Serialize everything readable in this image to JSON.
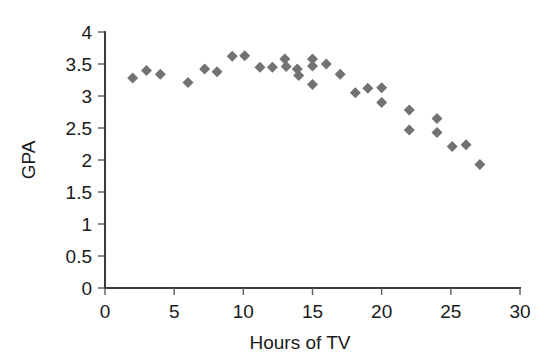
{
  "chart_data": {
    "type": "scatter",
    "title": "",
    "xlabel": "Hours of TV",
    "ylabel": "GPA",
    "xlim": [
      0,
      30
    ],
    "ylim": [
      0,
      4
    ],
    "grid": false,
    "legend": null,
    "marker": {
      "shape": "diamond",
      "color": "#727272",
      "size_px": 11
    },
    "axis_color": "#3a3a3a",
    "xticks": [
      0,
      5,
      10,
      15,
      20,
      25,
      30
    ],
    "xtick_labels": [
      "0",
      "5",
      "10",
      "15",
      "20",
      "25",
      "30"
    ],
    "yticks": [
      0,
      0.5,
      1,
      1.5,
      2,
      2.5,
      3,
      3.5,
      4
    ],
    "ytick_labels": [
      "0",
      "0.5",
      "1",
      "1.5",
      "2",
      "2.5",
      "3",
      "3.5",
      "4"
    ],
    "series": [
      {
        "name": "students",
        "points": [
          {
            "x": 2.0,
            "y": 3.28
          },
          {
            "x": 3.0,
            "y": 3.4
          },
          {
            "x": 4.0,
            "y": 3.34
          },
          {
            "x": 6.0,
            "y": 3.21
          },
          {
            "x": 7.2,
            "y": 3.42
          },
          {
            "x": 8.1,
            "y": 3.38
          },
          {
            "x": 9.2,
            "y": 3.62
          },
          {
            "x": 10.1,
            "y": 3.63
          },
          {
            "x": 11.2,
            "y": 3.45
          },
          {
            "x": 12.1,
            "y": 3.45
          },
          {
            "x": 13.0,
            "y": 3.58
          },
          {
            "x": 13.1,
            "y": 3.46
          },
          {
            "x": 13.9,
            "y": 3.42
          },
          {
            "x": 14.0,
            "y": 3.32
          },
          {
            "x": 15.0,
            "y": 3.58
          },
          {
            "x": 15.0,
            "y": 3.47
          },
          {
            "x": 15.0,
            "y": 3.18
          },
          {
            "x": 16.0,
            "y": 3.5
          },
          {
            "x": 17.0,
            "y": 3.34
          },
          {
            "x": 18.1,
            "y": 3.05
          },
          {
            "x": 19.0,
            "y": 3.12
          },
          {
            "x": 20.0,
            "y": 3.13
          },
          {
            "x": 20.0,
            "y": 2.9
          },
          {
            "x": 22.0,
            "y": 2.78
          },
          {
            "x": 22.0,
            "y": 2.47
          },
          {
            "x": 24.0,
            "y": 2.65
          },
          {
            "x": 24.0,
            "y": 2.43
          },
          {
            "x": 25.1,
            "y": 2.21
          },
          {
            "x": 26.1,
            "y": 2.24
          },
          {
            "x": 27.1,
            "y": 1.93
          }
        ]
      }
    ]
  }
}
